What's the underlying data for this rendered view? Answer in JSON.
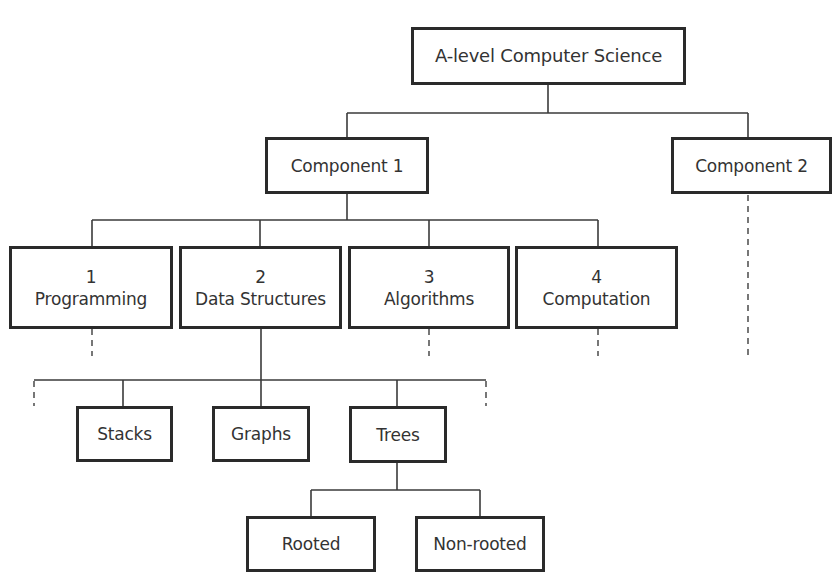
{
  "diagram": {
    "root": {
      "label": "A-level Computer Science"
    },
    "components": [
      {
        "label": "Component 1"
      },
      {
        "label": "Component 2"
      }
    ],
    "topics": [
      {
        "number": "1",
        "label": "Programming"
      },
      {
        "number": "2",
        "label": "Data Structures"
      },
      {
        "number": "3",
        "label": "Algorithms"
      },
      {
        "number": "4",
        "label": "Computation"
      }
    ],
    "data_structures": [
      {
        "label": "Stacks"
      },
      {
        "label": "Graphs"
      },
      {
        "label": "Trees"
      }
    ],
    "trees": [
      {
        "label": "Rooted"
      },
      {
        "label": "Non-rooted"
      }
    ],
    "colors": {
      "box_border": "#2a2a2a",
      "line": "#3a3a3a",
      "text": "#333333",
      "background": "#ffffff"
    }
  }
}
